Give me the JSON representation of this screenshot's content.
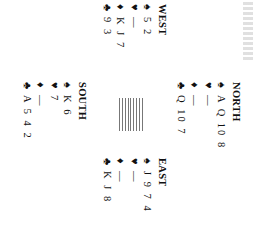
{
  "diagram": {
    "type": "bridge-deal",
    "rotation_deg": 90,
    "hands": {
      "north": {
        "label": "NORTH",
        "spades": "A Q 10 8",
        "hearts": "—",
        "diamonds": "—",
        "clubs": "Q 10 7"
      },
      "west": {
        "label": "WEST",
        "spades": "5 2",
        "hearts": "—",
        "diamonds": "K J 7",
        "clubs": "9 3"
      },
      "east": {
        "label": "EAST",
        "spades": "J 9 7 4",
        "hearts": "—",
        "diamonds": "—",
        "clubs": "K J 8"
      },
      "south": {
        "label": "SOUTH",
        "spades": "K 6",
        "hearts": "7",
        "diamonds": "—",
        "clubs": "A 5 4 2"
      }
    },
    "suit_symbols": {
      "spades": "♠",
      "hearts": "♥",
      "diamonds": "♦",
      "clubs": "♣"
    },
    "table_icon": "table-lines-icon"
  }
}
